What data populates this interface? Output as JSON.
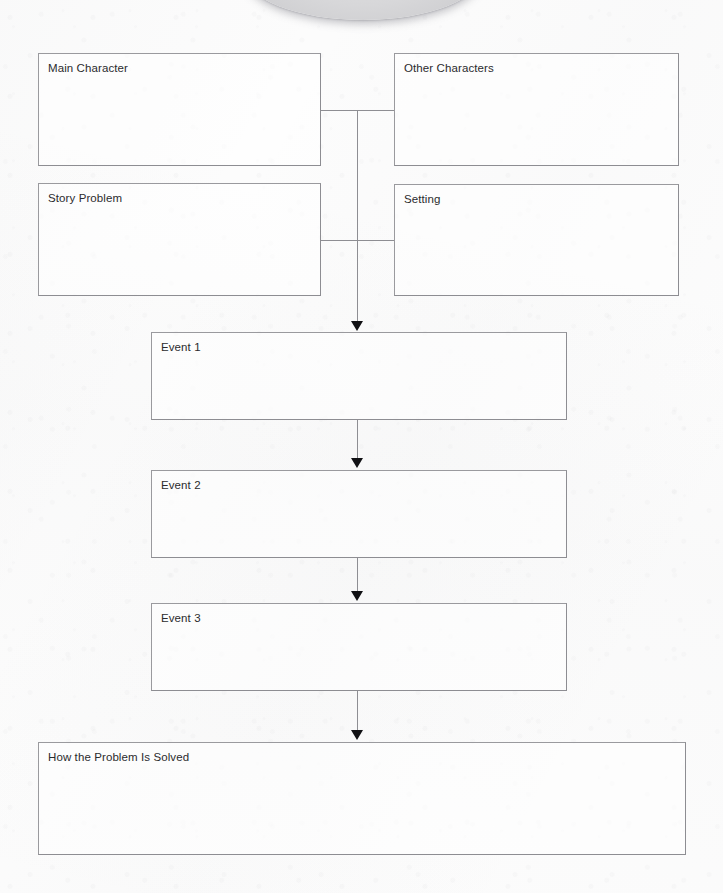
{
  "organizer": {
    "title": "Story Map",
    "decoration": {
      "top_shape": "gray-oval"
    },
    "boxes": [
      {
        "key": "main_character",
        "label": "Main Character",
        "value": ""
      },
      {
        "key": "other_characters",
        "label": "Other Characters",
        "value": ""
      },
      {
        "key": "story_problem",
        "label": "Story Problem",
        "value": ""
      },
      {
        "key": "setting",
        "label": "Setting",
        "value": ""
      },
      {
        "key": "event_1",
        "label": "Event 1",
        "value": ""
      },
      {
        "key": "event_2",
        "label": "Event 2",
        "value": ""
      },
      {
        "key": "event_3",
        "label": "Event 3",
        "value": ""
      },
      {
        "key": "solution",
        "label": "How the Problem Is Solved",
        "value": ""
      }
    ],
    "connectors": [
      {
        "key": "top_pair",
        "type": "horizontal",
        "from": "main_character",
        "to": "other_characters"
      },
      {
        "key": "mid_pair",
        "type": "horizontal",
        "from": "story_problem",
        "to": "setting"
      },
      {
        "key": "spine",
        "type": "vertical",
        "from": "top_pair",
        "to": "event_1"
      },
      {
        "key": "event1_event2",
        "type": "arrow",
        "from": "event_1",
        "to": "event_2"
      },
      {
        "key": "event2_event3",
        "type": "arrow",
        "from": "event_2",
        "to": "event_3"
      },
      {
        "key": "event3_solution",
        "type": "arrow",
        "from": "event_3",
        "to": "solution"
      }
    ],
    "colors": {
      "page_background": "#fcfcfc",
      "box_border": "#9a9a9e",
      "label_text": "#2b2b2d",
      "connector_line": "#8e8e93",
      "arrow_head": "#111114",
      "oval_fill": "#d7d7d9"
    }
  }
}
